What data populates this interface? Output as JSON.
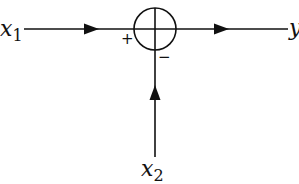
{
  "diagram": {
    "type": "summing-junction",
    "colors": {
      "stroke": "#111111",
      "background": "#ffffff"
    },
    "inputs": [
      {
        "name": "x",
        "subscript": "1",
        "sign": "+",
        "direction": "from-left"
      },
      {
        "name": "x",
        "subscript": "2",
        "sign": "−",
        "direction": "from-below"
      }
    ],
    "output": {
      "name": "y",
      "direction": "to-right"
    },
    "junction": {
      "symbol": "circle-with-cross"
    }
  }
}
